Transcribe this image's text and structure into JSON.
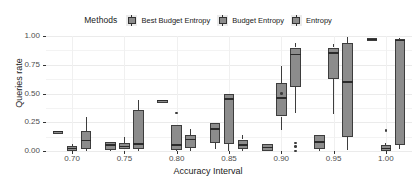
{
  "legend": {
    "title": "Methods",
    "items": [
      {
        "label": "Best Budget Entropy",
        "key": "legend-key-box"
      },
      {
        "label": "Budget Entropy",
        "key": "legend-key-box"
      },
      {
        "label": "Entropy",
        "key": "legend-key-box"
      }
    ]
  },
  "colors": {
    "box_fill": "#8c8c8c",
    "box_border": "#3d3d3d",
    "median": "#2b2b2b",
    "grid": "#ebebeb",
    "panel_bg": "#ffffff",
    "text": "#1a1a1a",
    "tick_text": "#4d4d4d"
  },
  "chart_data": {
    "type": "box",
    "title": "",
    "xlabel": "Accuracy Interval",
    "ylabel": "Queries rate",
    "ylim": [
      0.0,
      1.0
    ],
    "yticks": [
      "0.00",
      "0.25",
      "0.50",
      "0.75",
      "1.00"
    ],
    "ytick_values": [
      0.0,
      0.25,
      0.5,
      0.75,
      1.0
    ],
    "categories": [
      "0.70",
      "0.75",
      "0.80",
      "0.85",
      "0.90",
      "0.95",
      "1.00"
    ],
    "legend_position": "top",
    "grid": true,
    "series": [
      {
        "name": "Best Budget Entropy",
        "boxes": [
          {
            "category": "0.70",
            "lower_whisker": 0.17,
            "q1": 0.17,
            "median": 0.17,
            "q3": 0.17,
            "upper_whisker": 0.17,
            "outliers": []
          },
          {
            "category": "0.75",
            "lower_whisker": 0.0,
            "q1": 0.01,
            "median": 0.05,
            "q3": 0.08,
            "upper_whisker": 0.08,
            "outliers": []
          },
          {
            "category": "0.80",
            "lower_whisker": 0.44,
            "q1": 0.44,
            "median": 0.44,
            "q3": 0.44,
            "upper_whisker": 0.44,
            "outliers": []
          },
          {
            "category": "0.85",
            "lower_whisker": 0.02,
            "q1": 0.07,
            "median": 0.19,
            "q3": 0.24,
            "upper_whisker": 0.24,
            "outliers": []
          },
          {
            "category": "0.90",
            "lower_whisker": 0.0,
            "q1": 0.0,
            "median": 0.03,
            "q3": 0.06,
            "upper_whisker": 0.06,
            "outliers": []
          },
          {
            "category": "0.95",
            "lower_whisker": 0.0,
            "q1": 0.02,
            "median": 0.08,
            "q3": 0.14,
            "upper_whisker": 0.14,
            "outliers": []
          },
          {
            "category": "1.00",
            "lower_whisker": 0.96,
            "q1": 0.96,
            "median": 0.97,
            "q3": 0.98,
            "upper_whisker": 0.98,
            "outliers": []
          }
        ]
      },
      {
        "name": "Budget Entropy",
        "boxes": [
          {
            "category": "0.70",
            "lower_whisker": 0.0,
            "q1": 0.0,
            "median": 0.02,
            "q3": 0.04,
            "upper_whisker": 0.06,
            "outliers": []
          },
          {
            "category": "0.75",
            "lower_whisker": 0.02,
            "q1": 0.02,
            "median": 0.04,
            "q3": 0.07,
            "upper_whisker": 0.12,
            "outliers": []
          },
          {
            "category": "0.80",
            "lower_whisker": 0.0,
            "q1": 0.01,
            "median": 0.05,
            "q3": 0.23,
            "upper_whisker": 0.23,
            "outliers": [
              0.33
            ]
          },
          {
            "category": "0.85",
            "lower_whisker": 0.0,
            "q1": 0.06,
            "median": 0.45,
            "q3": 0.5,
            "upper_whisker": 0.5,
            "outliers": []
          },
          {
            "category": "0.90",
            "lower_whisker": 0.18,
            "q1": 0.3,
            "median": 0.46,
            "q3": 0.59,
            "upper_whisker": 0.74,
            "outliers": [
              0.5
            ]
          },
          {
            "category": "0.95",
            "lower_whisker": 0.32,
            "q1": 0.63,
            "median": 0.85,
            "q3": 0.9,
            "upper_whisker": 0.93,
            "outliers": []
          },
          {
            "category": "1.00",
            "lower_whisker": 0.0,
            "q1": 0.0,
            "median": 0.02,
            "q3": 0.05,
            "upper_whisker": 0.07,
            "outliers": [
              0.18
            ]
          }
        ]
      },
      {
        "name": "Entropy",
        "boxes": [
          {
            "category": "0.70",
            "lower_whisker": 0.0,
            "q1": 0.02,
            "median": 0.09,
            "q3": 0.17,
            "upper_whisker": 0.3,
            "outliers": []
          },
          {
            "category": "0.75",
            "lower_whisker": 0.0,
            "q1": 0.02,
            "median": 0.06,
            "q3": 0.36,
            "upper_whisker": 0.44,
            "outliers": []
          },
          {
            "category": "0.80",
            "lower_whisker": 0.0,
            "q1": 0.03,
            "median": 0.1,
            "q3": 0.14,
            "upper_whisker": 0.19,
            "outliers": []
          },
          {
            "category": "0.85",
            "lower_whisker": 0.0,
            "q1": 0.02,
            "median": 0.05,
            "q3": 0.1,
            "upper_whisker": 0.14,
            "outliers": []
          },
          {
            "category": "0.90",
            "lower_whisker": 0.33,
            "q1": 0.56,
            "median": 0.84,
            "q3": 0.9,
            "upper_whisker": 0.94,
            "outliers": [
              0.07,
              0.04,
              0.0
            ]
          },
          {
            "category": "0.95",
            "lower_whisker": 0.01,
            "q1": 0.12,
            "median": 0.6,
            "q3": 0.94,
            "upper_whisker": 0.99,
            "outliers": []
          },
          {
            "category": "1.00",
            "lower_whisker": 0.02,
            "q1": 0.05,
            "median": 0.96,
            "q3": 0.97,
            "upper_whisker": 0.98,
            "outliers": []
          }
        ]
      }
    ]
  }
}
